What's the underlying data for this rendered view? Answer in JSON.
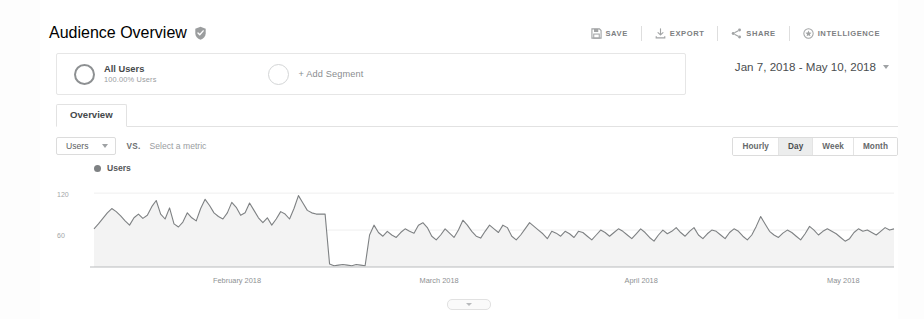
{
  "header": {
    "title": "Audience Overview",
    "verified_icon": "shield-check-icon"
  },
  "toolbar": {
    "items": [
      {
        "label": "SAVE",
        "icon": "save-icon"
      },
      {
        "label": "EXPORT",
        "icon": "export-download-icon"
      },
      {
        "label": "SHARE",
        "icon": "share-nodes-icon"
      },
      {
        "label": "INTELLIGENCE",
        "icon": "intelligence-star-icon"
      }
    ]
  },
  "segments": {
    "all_users": {
      "name": "All Users",
      "subtitle": "100.00% Users"
    },
    "add_segment_label": "+ Add Segment"
  },
  "date_range": {
    "value": "Jan 7, 2018 - May 10, 2018"
  },
  "tabs": [
    {
      "label": "Overview",
      "active": true
    }
  ],
  "metric_row": {
    "metric_selected": "Users",
    "vs_label": "VS.",
    "select_metric_placeholder": "Select a metric"
  },
  "granularity": {
    "options": [
      "Hourly",
      "Day",
      "Week",
      "Month"
    ],
    "selected": "Day"
  },
  "chart_data": {
    "type": "line",
    "title": "",
    "legend": [
      "Users"
    ],
    "legend_position": "top-left",
    "xlabel": "",
    "ylabel": "",
    "ylim": [
      0,
      130
    ],
    "yticks": [
      60,
      120
    ],
    "ytick_labels": [
      "60",
      "120"
    ],
    "grid": true,
    "x_tick_labels": [
      "February 2018",
      "March 2018",
      "April 2018",
      "May 2018"
    ],
    "x_tick_positions": [
      0.215,
      0.455,
      0.695,
      0.935
    ],
    "accent_color": "#7e8183",
    "fill_color": "#f3f3f3",
    "series": [
      {
        "name": "Users",
        "values": [
          62,
          70,
          79,
          88,
          95,
          90,
          83,
          75,
          68,
          80,
          86,
          79,
          84,
          98,
          108,
          86,
          78,
          96,
          70,
          65,
          73,
          88,
          80,
          75,
          95,
          110,
          100,
          88,
          82,
          78,
          88,
          105,
          97,
          84,
          88,
          104,
          92,
          80,
          72,
          80,
          68,
          78,
          90,
          86,
          78,
          95,
          116,
          104,
          92,
          88,
          86,
          86,
          86,
          5,
          2,
          3,
          4,
          3,
          2,
          4,
          3,
          2,
          52,
          68,
          56,
          50,
          58,
          52,
          48,
          56,
          62,
          58,
          55,
          68,
          72,
          64,
          50,
          44,
          52,
          62,
          55,
          48,
          60,
          76,
          68,
          58,
          50,
          47,
          58,
          68,
          62,
          56,
          68,
          64,
          50,
          44,
          52,
          62,
          72,
          66,
          60,
          54,
          46,
          58,
          55,
          50,
          58,
          54,
          48,
          58,
          56,
          50,
          44,
          52,
          60,
          56,
          50,
          56,
          62,
          58,
          52,
          46,
          54,
          62,
          56,
          48,
          42,
          52,
          60,
          54,
          58,
          64,
          56,
          50,
          58,
          64,
          52,
          46,
          54,
          60,
          58,
          52,
          46,
          56,
          62,
          58,
          50,
          44,
          52,
          66,
          82,
          70,
          58,
          52,
          48,
          55,
          60,
          56,
          50,
          44,
          54,
          66,
          60,
          52,
          58,
          62,
          58,
          54,
          48,
          42,
          46,
          56,
          62,
          58,
          60,
          56,
          52,
          58,
          64,
          60,
          62
        ]
      }
    ]
  },
  "drag_handle": {
    "icon": "collapse-handle-icon"
  }
}
